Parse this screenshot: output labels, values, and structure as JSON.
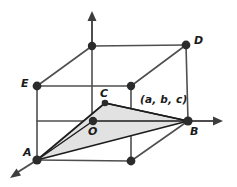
{
  "figure": {
    "background_color": "#ffffff",
    "axis_color": "#4d4d4d",
    "edge_color": "#4f4f4f",
    "triangle_edge_color": "#1c1c1c",
    "triangle_fill_color": "#e2e2e2",
    "vertex_color": "#2b2b2b"
  },
  "labels": {
    "origin": "O",
    "vertex_a": "A",
    "vertex_b": "B",
    "vertex_c": "C",
    "vertex_d": "D",
    "vertex_e": "E",
    "point_coordinates": "(a, b, c)"
  },
  "geometry": {
    "points": {
      "O": [
        93,
        121
      ],
      "A": [
        37,
        160
      ],
      "B": [
        188,
        121
      ],
      "C": [
        105,
        103
      ],
      "D": [
        186,
        45
      ],
      "E": [
        37,
        86
      ],
      "top_on_axis": [
        92,
        46
      ],
      "back_top_right": [
        131,
        86
      ],
      "front_bottom": [
        131,
        161
      ]
    },
    "axis_arrow_tips": {
      "z_up": [
        92,
        13
      ],
      "x_right": [
        222,
        121
      ],
      "y_front_left": [
        11,
        178
      ]
    }
  }
}
